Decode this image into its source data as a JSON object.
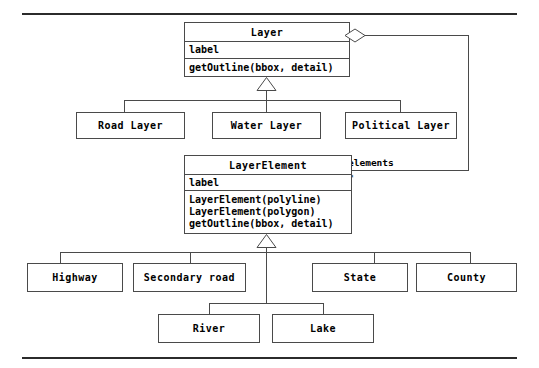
{
  "diagram": {
    "type": "uml-class-diagram",
    "classes": {
      "layer": {
        "name": "Layer",
        "attributes": [
          "label"
        ],
        "operations": [
          "getOutline(bbox, detail)"
        ]
      },
      "layer_element": {
        "name": "LayerElement",
        "attributes": [
          "label"
        ],
        "operations": [
          "LayerElement(polyline)",
          "LayerElement(polygon)",
          "getOutline(bbox, detail)"
        ]
      }
    },
    "layer_subclasses": [
      {
        "name": "Road Layer"
      },
      {
        "name": "Water Layer"
      },
      {
        "name": "Political Layer"
      }
    ],
    "element_subclasses": [
      {
        "name": "Highway"
      },
      {
        "name": "Secondary road"
      },
      {
        "name": "State"
      },
      {
        "name": "County"
      }
    ],
    "element_subclasses_lower": [
      {
        "name": "River"
      },
      {
        "name": "Lake"
      }
    ],
    "association": {
      "role_label": "elements",
      "multiplicity": "*",
      "kind": "aggregation"
    },
    "colors": {
      "line": "#4a4a4a",
      "rule": "#2b2b2b",
      "text": "#000000",
      "background": "#ffffff"
    }
  }
}
